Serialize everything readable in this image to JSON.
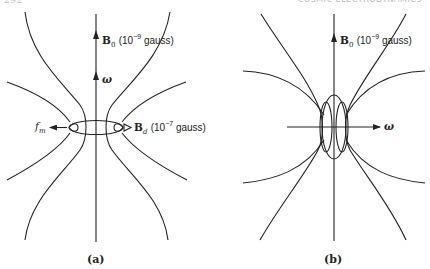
{
  "header": {
    "page_number": "292",
    "running_title": "COSMIC ELECTRODYNAMICS"
  },
  "panel_a": {
    "caption": "(a)",
    "labels": {
      "b0_symbol": "B",
      "b0_sub": "0",
      "b0_value": "(10",
      "b0_exp": "−9",
      "b0_unit": " gauss)",
      "omega": "ω",
      "fm_symbol": "f",
      "fm_sub": "m",
      "bd_symbol": "B",
      "bd_sub": "d",
      "bd_value": "(10",
      "bd_exp": "−7",
      "bd_unit": " gauss)"
    }
  },
  "panel_b": {
    "caption": "(b)",
    "labels": {
      "b0_symbol": "B",
      "b0_sub": "0",
      "b0_value": "(10",
      "b0_exp": "−9",
      "b0_unit": " gauss)",
      "omega": "ω"
    }
  },
  "colors": {
    "line": "#222222",
    "background": "#ffffff"
  }
}
